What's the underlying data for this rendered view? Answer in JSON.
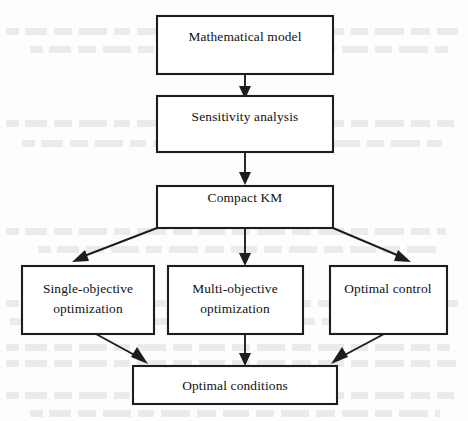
{
  "diagram": {
    "type": "flowchart",
    "orientation": "top-to-bottom",
    "colors": {
      "background": "#fdfdfb",
      "box_fill": "#ffffff",
      "stroke": "#1d1d1d",
      "text": "#101010"
    },
    "nodes": [
      {
        "id": "mathematical-model",
        "label": "Mathematical model",
        "lines": [
          "Mathematical model"
        ],
        "row": 1
      },
      {
        "id": "sensitivity-analysis",
        "label": "Sensitivity analysis",
        "lines": [
          "Sensitivity analysis"
        ],
        "row": 2
      },
      {
        "id": "compact-km",
        "label": "Compact KM",
        "lines": [
          "Compact KM"
        ],
        "row": 3
      },
      {
        "id": "single-objective-optimization",
        "label": "Single-objective optimization",
        "lines": [
          "Single-objective",
          "optimization"
        ],
        "row": 4
      },
      {
        "id": "multi-objective-optimization",
        "label": "Multi-objective optimization",
        "lines": [
          "Multi-objective",
          "optimization"
        ],
        "row": 4
      },
      {
        "id": "optimal-control",
        "label": "Optimal control",
        "lines": [
          "Optimal control"
        ],
        "row": 4
      },
      {
        "id": "optimal-conditions",
        "label": "Optimal conditions",
        "lines": [
          "Optimal conditions"
        ],
        "row": 5
      }
    ],
    "edges": [
      {
        "from": "mathematical-model",
        "to": "sensitivity-analysis",
        "style": "straight-down",
        "arrow": true
      },
      {
        "from": "sensitivity-analysis",
        "to": "compact-km",
        "style": "straight-down",
        "arrow": true
      },
      {
        "from": "compact-km",
        "to": "single-objective-optimization",
        "style": "diagonal-left",
        "arrow": true
      },
      {
        "from": "compact-km",
        "to": "multi-objective-optimization",
        "style": "straight-down",
        "arrow": true
      },
      {
        "from": "compact-km",
        "to": "optimal-control",
        "style": "diagonal-right",
        "arrow": true
      },
      {
        "from": "single-objective-optimization",
        "to": "optimal-conditions",
        "style": "diagonal-right-down",
        "arrow": true
      },
      {
        "from": "multi-objective-optimization",
        "to": "optimal-conditions",
        "style": "straight-down",
        "arrow": true
      },
      {
        "from": "optimal-control",
        "to": "optimal-conditions",
        "style": "diagonal-left-down",
        "arrow": true
      }
    ]
  }
}
